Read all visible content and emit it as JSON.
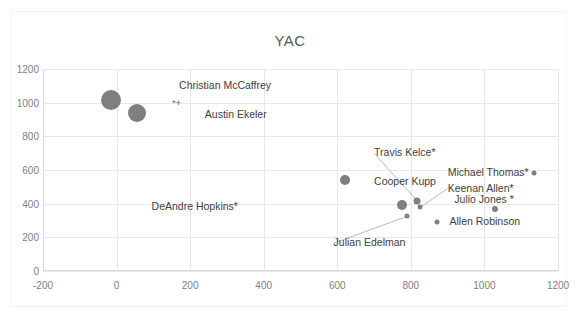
{
  "chart_data": {
    "type": "scatter",
    "title": "YAC",
    "xlabel": "",
    "ylabel": "",
    "xlim": [
      -200,
      1200
    ],
    "ylim": [
      0,
      1200
    ],
    "xticks": [
      -200,
      0,
      200,
      400,
      600,
      800,
      1000,
      1200
    ],
    "yticks": [
      0,
      200,
      400,
      600,
      800,
      1000,
      1200
    ],
    "grid": true,
    "legend": "none",
    "marker_color": "#7f7f7f",
    "points": [
      {
        "label": "Christian McCaffrey",
        "x": -15,
        "y": 1015,
        "size": 20,
        "label_x": 170,
        "label_y": 1100,
        "leader": false,
        "asterisk": false
      },
      {
        "label": "Austin Ekeler",
        "x": 55,
        "y": 940,
        "size": 18,
        "label_x": 240,
        "label_y": 925,
        "leader": false,
        "asterisk": false
      },
      {
        "label": "Cooper Kupp",
        "x": 620,
        "y": 540,
        "size": 10,
        "label_x": 700,
        "label_y": 527,
        "leader": false,
        "asterisk": false
      },
      {
        "label": "DeAndre Hopkins*",
        "x": 775,
        "y": 390,
        "size": 10,
        "label_x": 330,
        "label_y": 378,
        "leader": false,
        "asterisk": false
      },
      {
        "label": "Travis Kelce*",
        "x": 818,
        "y": 415,
        "size": 7,
        "label_x": 700,
        "label_y": 700,
        "leader": true,
        "asterisk": false
      },
      {
        "label": "Keenan Allen*",
        "x": 826,
        "y": 378,
        "size": 5,
        "label_x": 900,
        "label_y": 490,
        "leader": true,
        "asterisk": false
      },
      {
        "label": "Julian Edelman",
        "x": 790,
        "y": 325,
        "size": 5,
        "label_x": 590,
        "label_y": 165,
        "leader": true,
        "asterisk": false
      },
      {
        "label": "Michael Thomas*",
        "x": 1135,
        "y": 585,
        "size": 5,
        "label_x": 1120,
        "label_y": 585,
        "leader": false,
        "asterisk": false
      },
      {
        "label": "Julio Jones *",
        "x": 1030,
        "y": 370,
        "size": 6,
        "label_x": 1080,
        "label_y": 420,
        "leader": false,
        "asterisk": false
      },
      {
        "label": "Allen Robinson",
        "x": 870,
        "y": 290,
        "size": 5,
        "label_x": 905,
        "label_y": 290,
        "leader": false,
        "asterisk": false
      }
    ],
    "extra_marks": [
      {
        "name": "ekeler-star-plus",
        "text": "*+",
        "x": 163,
        "y": 1000
      }
    ]
  }
}
